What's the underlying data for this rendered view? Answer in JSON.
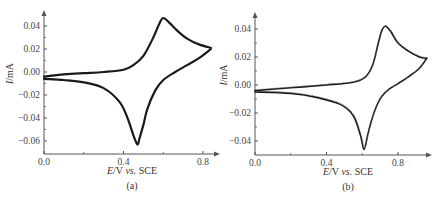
{
  "chart_data": [
    {
      "type": "line",
      "panel_label": "(a)",
      "xlabel_italic": "E",
      "xlabel_rest": "/V vs. SCE",
      "ylabel_italic": "I",
      "ylabel_rest": "/mA",
      "xlim": [
        0.0,
        0.85
      ],
      "ylim": [
        -0.068,
        0.052
      ],
      "xticks": [
        "0.0",
        "0.4",
        "0.8"
      ],
      "yticks": [
        "0.04",
        "0.02",
        "0.00",
        "-0.02",
        "-0.04",
        "-0.06"
      ],
      "series": [
        {
          "name": "cyclic voltammogram (a) - anodic sweep",
          "x": [
            0.0,
            0.1,
            0.2,
            0.3,
            0.4,
            0.45,
            0.5,
            0.55,
            0.58,
            0.6,
            0.63,
            0.67,
            0.72,
            0.78,
            0.84
          ],
          "y": [
            -0.004,
            -0.002,
            -0.001,
            0.0,
            0.002,
            0.006,
            0.014,
            0.03,
            0.042,
            0.047,
            0.043,
            0.036,
            0.029,
            0.024,
            0.021
          ]
        },
        {
          "name": "cyclic voltammogram (a) - cathodic sweep",
          "x": [
            0.84,
            0.78,
            0.72,
            0.66,
            0.6,
            0.56,
            0.52,
            0.5,
            0.48,
            0.47,
            0.45,
            0.42,
            0.38,
            0.3,
            0.2,
            0.1,
            0.0
          ],
          "y": [
            0.02,
            0.012,
            0.006,
            0.0,
            -0.007,
            -0.016,
            -0.032,
            -0.046,
            -0.058,
            -0.063,
            -0.055,
            -0.04,
            -0.026,
            -0.014,
            -0.009,
            -0.007,
            -0.006
          ]
        }
      ]
    },
    {
      "type": "line",
      "panel_label": "(b)",
      "xlabel_italic": "E",
      "xlabel_rest": "/V vs. SCE",
      "ylabel_italic": "I",
      "ylabel_rest": "/mA",
      "xlim": [
        0.0,
        1.0
      ],
      "ylim": [
        -0.05,
        0.05
      ],
      "xticks": [
        "0.0",
        "0.4",
        "0.8"
      ],
      "yticks": [
        "0.04",
        "0.02",
        "0.00",
        "-0.02",
        "-0.04"
      ],
      "series": [
        {
          "name": "cyclic voltammogram (b) - anodic sweep",
          "x": [
            0.0,
            0.2,
            0.4,
            0.55,
            0.62,
            0.66,
            0.69,
            0.71,
            0.73,
            0.76,
            0.8,
            0.86,
            0.92,
            0.96
          ],
          "y": [
            -0.004,
            -0.002,
            0.0,
            0.002,
            0.006,
            0.015,
            0.03,
            0.039,
            0.042,
            0.038,
            0.03,
            0.024,
            0.02,
            0.019
          ]
        },
        {
          "name": "cyclic voltammogram (b) - cathodic sweep",
          "x": [
            0.96,
            0.92,
            0.86,
            0.8,
            0.75,
            0.71,
            0.68,
            0.65,
            0.63,
            0.61,
            0.59,
            0.55,
            0.48,
            0.35,
            0.2,
            0.0
          ],
          "y": [
            0.019,
            0.012,
            0.006,
            0.001,
            -0.003,
            -0.008,
            -0.015,
            -0.026,
            -0.036,
            -0.046,
            -0.036,
            -0.022,
            -0.014,
            -0.009,
            -0.006,
            -0.005
          ]
        },
        {
          "name": "simulated (dotted)",
          "style": "dotted",
          "note": "dotted trace overlapping the measured curve"
        }
      ]
    }
  ]
}
